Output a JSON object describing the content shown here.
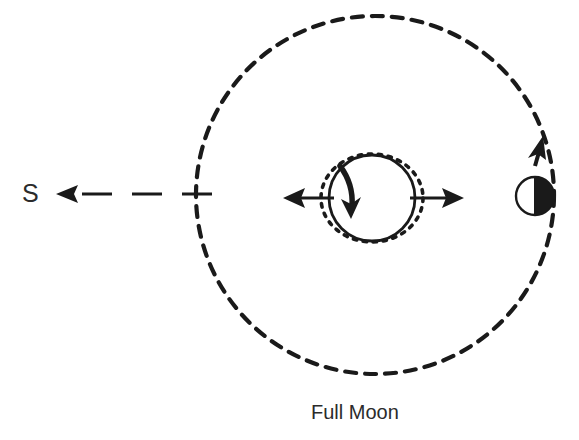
{
  "figure": {
    "title_caption": "Full Moon",
    "sun_label": "S",
    "background_color": "#ffffff",
    "ink_color": "#1a1a1a",
    "text_color": "#2b2b2b"
  },
  "diagram": {
    "type": "astronomy-schematic",
    "elements": {
      "sun_direction": {
        "name": "direction to Sun",
        "label": "S",
        "label_x": 22,
        "label_y": 199,
        "arrow_tip_x": 58,
        "arrow_tip_y": 194,
        "line_start_x": 210,
        "line_end_x": 58,
        "line_y": 194,
        "dash_pattern": "26 16",
        "stroke_width": 3
      },
      "moon_orbit": {
        "name": "Moon orbit",
        "center_x": 375,
        "center_y": 195,
        "radius": 179,
        "dash_pattern": "11 9",
        "stroke_width": 4.2
      },
      "earth": {
        "name": "Earth",
        "center_x": 372,
        "center_y": 198,
        "radius": 43,
        "stroke_width": 2.6
      },
      "tidal_bulge": {
        "name": "tidal bulge envelope",
        "center_x": 372,
        "center_y": 198,
        "radius_x": 51,
        "radius_y": 44,
        "dash_pattern": "4 6",
        "stroke_width": 3.4
      },
      "bulge_arrow_left": {
        "name": "left tidal bulge arrow",
        "tail_x": 330,
        "tail_y": 198,
        "tip_x": 286,
        "tip_y": 198
      },
      "bulge_arrow_right": {
        "name": "right tidal bulge arrow",
        "tail_x": 414,
        "tail_y": 198,
        "tip_x": 462,
        "tip_y": 198
      },
      "rotation_arrow": {
        "name": "Earth rotation arrow",
        "description": "curved arrow inside Earth pointing downward"
      },
      "moon": {
        "name": "Moon",
        "center_x": 535,
        "center_y": 196,
        "radius": 19,
        "lit_side": "left",
        "dark_side": "right",
        "stroke_width": 2.2
      },
      "orbit_direction_arrow": {
        "name": "orbital motion arrow",
        "description": "arrow along orbit pointing counterclockwise (up-right)",
        "tip_x": 541,
        "tip_y": 139
      }
    }
  }
}
